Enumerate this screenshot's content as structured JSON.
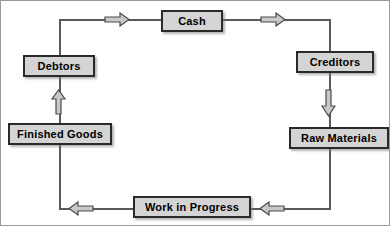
{
  "diagram": {
    "style": {
      "box_fill": "#d4d4d4",
      "box_border": "#2a2a2a",
      "line_color": "#5a5a5a",
      "arrow_fill": "#c8c8c8",
      "arrow_border": "#4a4a4a",
      "frame_border": "#9a9a9a",
      "background": "#ffffff"
    },
    "nodes": [
      {
        "id": "cash",
        "label": "Cash",
        "x": 160,
        "y": 9,
        "w": 62,
        "h": 22
      },
      {
        "id": "debtors",
        "label": "Debtors",
        "x": 22,
        "y": 54,
        "w": 72,
        "h": 22
      },
      {
        "id": "creditors",
        "label": "Creditors",
        "x": 295,
        "y": 50,
        "w": 78,
        "h": 22
      },
      {
        "id": "finished-goods",
        "label": "Finished Goods",
        "x": 7,
        "y": 122,
        "w": 104,
        "h": 22
      },
      {
        "id": "raw-materials",
        "label": "Raw Materials",
        "x": 288,
        "y": 126,
        "w": 100,
        "h": 22
      },
      {
        "id": "work-in-progress",
        "label": "Work in Progress",
        "x": 132,
        "y": 195,
        "w": 118,
        "h": 22
      }
    ],
    "arrows": [
      {
        "id": "cash-to-creditors-upper-left",
        "direction": "right",
        "x": 103,
        "y": 13
      },
      {
        "id": "cash-to-creditors",
        "direction": "right",
        "x": 259,
        "y": 13
      },
      {
        "id": "debtors-inflow",
        "direction": "up",
        "x": 49,
        "y": 88
      },
      {
        "id": "creditors-to-raw-materials",
        "direction": "down",
        "x": 320,
        "y": 88
      },
      {
        "id": "wip-to-finished-goods",
        "direction": "left",
        "x": 67,
        "y": 198
      },
      {
        "id": "raw-materials-to-wip",
        "direction": "left",
        "x": 258,
        "y": 198
      }
    ]
  }
}
